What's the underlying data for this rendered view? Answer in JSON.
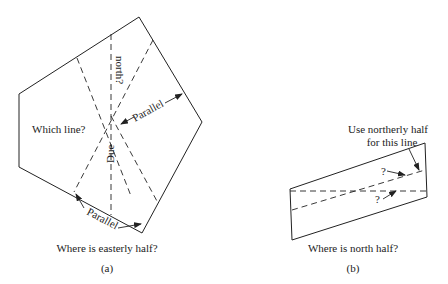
{
  "panel_a": {
    "labels": {
      "north": "north?",
      "due": "Due",
      "which_line": "Which line?",
      "parallel_top": "Parallel",
      "parallel_bottom": "Parallel"
    },
    "caption": "Where is easterly half?",
    "tag": "(a)"
  },
  "panel_b": {
    "labels": {
      "use_line1": "Use northerly half",
      "use_line2": "for this line",
      "q1": "?",
      "q2": "?"
    },
    "caption": "Where is north half?",
    "tag": "(b)"
  },
  "colors": {
    "stroke": "#222222",
    "background": "#ffffff"
  }
}
